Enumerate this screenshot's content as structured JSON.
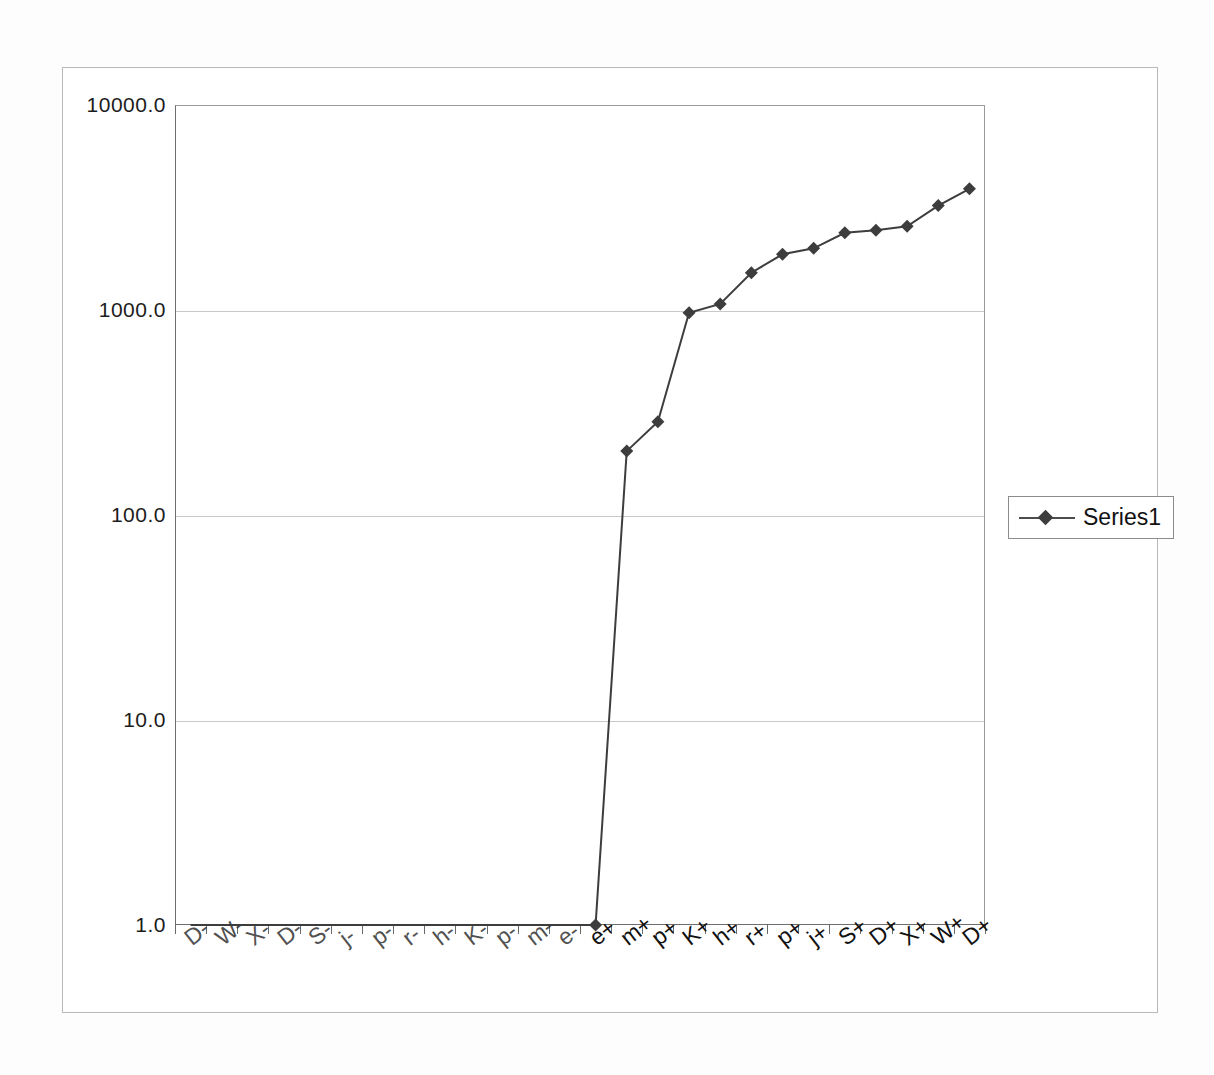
{
  "chart_data": {
    "type": "line",
    "title": "",
    "xlabel": "",
    "ylabel": "",
    "yscale": "log",
    "ylim": [
      1,
      10000
    ],
    "grid": true,
    "legend_position": "right",
    "y_ticks": [
      "1.0",
      "10.0",
      "100.0",
      "1000.0",
      "10000.0"
    ],
    "y_tick_values": [
      1,
      10,
      100,
      1000,
      10000
    ],
    "categories": [
      "D-",
      "W-",
      "X-",
      "D-",
      "S-",
      "j-",
      "p-",
      "r-",
      "h-",
      "K-",
      "p-",
      "m-",
      "e-",
      "e+",
      "m+",
      "p+",
      "K+",
      "h+",
      "r+",
      "p+",
      "j+",
      "S+",
      "D+",
      "X+",
      "W+",
      "D+"
    ],
    "series": [
      {
        "name": "Series1",
        "marker": "diamond",
        "color": "#3d3d3d",
        "values": [
          1,
          1,
          1,
          1,
          1,
          1,
          1,
          1,
          1,
          1,
          1,
          1,
          1,
          1,
          205,
          285,
          970,
          1070,
          1520,
          1870,
          2000,
          2380,
          2450,
          2560,
          3230,
          3900
        ]
      }
    ]
  },
  "legend": {
    "entries": [
      {
        "label": "Series1",
        "marker": "diamond-icon"
      }
    ]
  },
  "axes": {
    "y_axis_name": "value-axis",
    "x_axis_name": "category-axis"
  }
}
